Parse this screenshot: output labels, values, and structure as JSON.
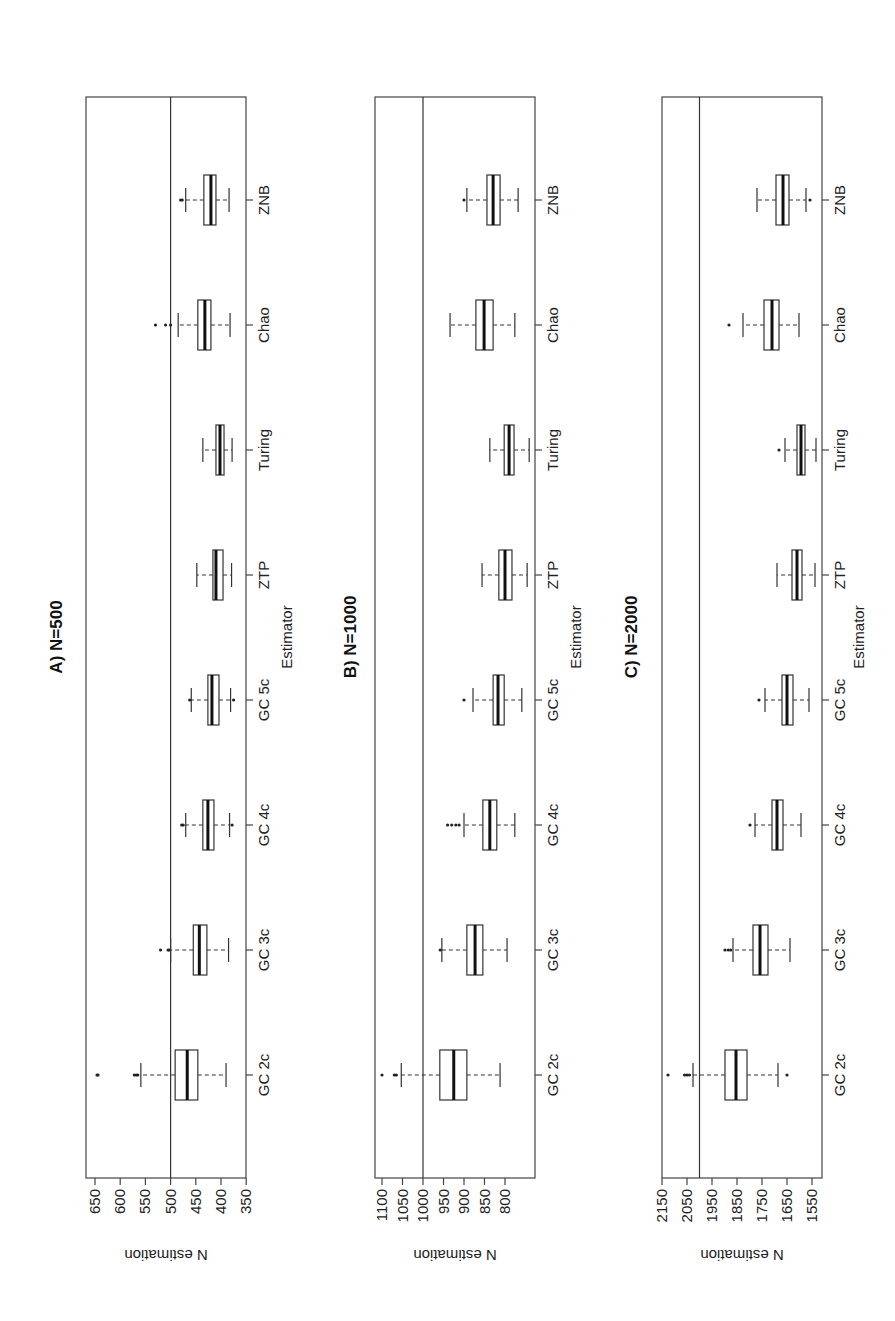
{
  "figure": {
    "orientation": "rotated-90-ccw"
  },
  "chart_data": [
    {
      "type": "boxplot",
      "title": "A) N=500",
      "xlabel": "Estimator",
      "ylabel": "N estimation",
      "categories": [
        "GC 2c",
        "GC 3c",
        "GC 4c",
        "GC 5c",
        "ZTP",
        "Turing",
        "Chao",
        "ZNB"
      ],
      "yticks": [
        350,
        400,
        450,
        500,
        550,
        600,
        650
      ],
      "ylim": [
        332,
        665
      ],
      "reference_line": 500,
      "boxes": [
        {
          "label": "GC 2c",
          "whisker_low": 390,
          "q1": 446,
          "median": 467,
          "q3": 491,
          "whisker_high": 559,
          "outliers": [
            646,
            644,
            572,
            568,
            565
          ]
        },
        {
          "label": "GC 3c",
          "whisker_low": 385,
          "q1": 428,
          "median": 443,
          "q3": 455,
          "whisker_high": 500,
          "outliers": [
            520,
            505,
            503
          ]
        },
        {
          "label": "GC 4c",
          "whisker_low": 383,
          "q1": 414,
          "median": 426,
          "q3": 436,
          "whisker_high": 470,
          "outliers": [
            478,
            475,
            378
          ]
        },
        {
          "label": "GC 5c",
          "whisker_low": 381,
          "q1": 404,
          "median": 418,
          "q3": 426,
          "whisker_high": 459,
          "outliers": [
            462,
            375
          ]
        },
        {
          "label": "ZTP",
          "whisker_low": 379,
          "q1": 396,
          "median": 410,
          "q3": 416,
          "whisker_high": 448,
          "outliers": []
        },
        {
          "label": "Turing",
          "whisker_low": 378,
          "q1": 394,
          "median": 402,
          "q3": 410,
          "whisker_high": 436,
          "outliers": []
        },
        {
          "label": "Chao",
          "whisker_low": 382,
          "q1": 420,
          "median": 432,
          "q3": 446,
          "whisker_high": 485,
          "outliers": [
            530,
            510,
            500
          ]
        },
        {
          "label": "ZNB",
          "whisker_low": 384,
          "q1": 410,
          "median": 420,
          "q3": 434,
          "whisker_high": 470,
          "outliers": [
            480,
            477
          ]
        }
      ]
    },
    {
      "type": "boxplot",
      "title": "B) N=1000",
      "xlabel": "Estimator",
      "ylabel": "N estimation",
      "categories": [
        "GC 2c",
        "GC 3c",
        "GC 4c",
        "GC 5c",
        "ZTP",
        "Turing",
        "Chao",
        "ZNB"
      ],
      "yticks": [
        800,
        850,
        900,
        950,
        1000,
        1050,
        1100
      ],
      "ylim": [
        725,
        1110
      ],
      "reference_line": 1000,
      "boxes": [
        {
          "label": "GC 2c",
          "whisker_low": 812,
          "q1": 893,
          "median": 925,
          "q3": 959,
          "whisker_high": 1053,
          "outliers": [
            1100,
            1070,
            1065
          ]
        },
        {
          "label": "GC 3c",
          "whisker_low": 795,
          "q1": 854,
          "median": 873,
          "q3": 893,
          "whisker_high": 954,
          "outliers": [
            958
          ]
        },
        {
          "label": "GC 4c",
          "whisker_low": 776,
          "q1": 820,
          "median": 837,
          "q3": 854,
          "whisker_high": 900,
          "outliers": [
            940,
            930,
            920,
            912
          ]
        },
        {
          "label": "GC 5c",
          "whisker_low": 759,
          "q1": 802,
          "median": 817,
          "q3": 829,
          "whisker_high": 878,
          "outliers": [
            900
          ]
        },
        {
          "label": "ZTP",
          "whisker_low": 746,
          "q1": 783,
          "median": 800,
          "q3": 815,
          "whisker_high": 856,
          "outliers": []
        },
        {
          "label": "Turing",
          "whisker_low": 741,
          "q1": 778,
          "median": 790,
          "q3": 802,
          "whisker_high": 837,
          "outliers": []
        },
        {
          "label": "Chao",
          "whisker_low": 776,
          "q1": 829,
          "median": 851,
          "q3": 871,
          "whisker_high": 934,
          "outliers": []
        },
        {
          "label": "ZNB",
          "whisker_low": 768,
          "q1": 812,
          "median": 829,
          "q3": 844,
          "whisker_high": 893,
          "outliers": [
            900
          ]
        }
      ]
    },
    {
      "type": "boxplot",
      "title": "C) N=2000",
      "xlabel": "Estimator",
      "ylabel": "N estimation",
      "categories": [
        "GC 2c",
        "GC 3c",
        "GC 4c",
        "GC 5c",
        "ZTP",
        "Turing",
        "Chao",
        "ZNB"
      ],
      "yticks": [
        1550,
        1650,
        1750,
        1850,
        1950,
        2050,
        2150
      ],
      "ylim": [
        1510,
        2150
      ],
      "reference_line": 2000,
      "boxes": [
        {
          "label": "GC 2c",
          "whisker_low": 1686,
          "q1": 1810,
          "median": 1854,
          "q3": 1898,
          "whisker_high": 2026,
          "outliers": [
            2126,
            2060,
            2050,
            2040,
            1650
          ]
        },
        {
          "label": "GC 3c",
          "whisker_low": 1638,
          "q1": 1726,
          "median": 1758,
          "q3": 1786,
          "whisker_high": 1866,
          "outliers": [
            1898,
            1885,
            1875
          ]
        },
        {
          "label": "GC 4c",
          "whisker_low": 1594,
          "q1": 1666,
          "median": 1690,
          "q3": 1710,
          "whisker_high": 1778,
          "outliers": [
            1798
          ]
        },
        {
          "label": "GC 5c",
          "whisker_low": 1562,
          "q1": 1626,
          "median": 1650,
          "q3": 1670,
          "whisker_high": 1738,
          "outliers": [
            1762
          ]
        },
        {
          "label": "ZTP",
          "whisker_low": 1538,
          "q1": 1590,
          "median": 1610,
          "q3": 1630,
          "whisker_high": 1690,
          "outliers": []
        },
        {
          "label": "Turing",
          "whisker_low": 1534,
          "q1": 1578,
          "median": 1594,
          "q3": 1610,
          "whisker_high": 1658,
          "outliers": [
            1682
          ]
        },
        {
          "label": "Chao",
          "whisker_low": 1602,
          "q1": 1682,
          "median": 1710,
          "q3": 1742,
          "whisker_high": 1826,
          "outliers": [
            1882
          ]
        },
        {
          "label": "ZNB",
          "whisker_low": 1574,
          "q1": 1642,
          "median": 1666,
          "q3": 1694,
          "whisker_high": 1770,
          "outliers": [
            1558
          ]
        }
      ]
    }
  ]
}
